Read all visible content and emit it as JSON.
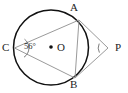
{
  "figure": {
    "kind": "circle-geometry-diagram",
    "background_color": "#ffffff",
    "circle_stroke_color": "#111111",
    "chord_stroke_color": "#9a9a9a",
    "label_color": "#1c1c1c",
    "points": {
      "A": {
        "label": "A",
        "x": 79,
        "y": 20
      },
      "B": {
        "label": "B",
        "x": 75,
        "y": 78
      },
      "C": {
        "label": "C",
        "x": 14,
        "y": 48
      },
      "O": {
        "label": "O",
        "x": 51,
        "y": 47
      },
      "P": {
        "label": "P",
        "x": 108,
        "y": 48
      }
    },
    "angles": {
      "at_C": {
        "value": "56",
        "degree_symbol": "°",
        "text": "56°"
      },
      "at_P": {
        "value": "",
        "text": ""
      }
    },
    "circle": {
      "cx": 51,
      "cy": 47.5,
      "r": 37.5
    },
    "center_dot": {
      "cx": 51,
      "cy": 47,
      "r": 1.8
    }
  }
}
